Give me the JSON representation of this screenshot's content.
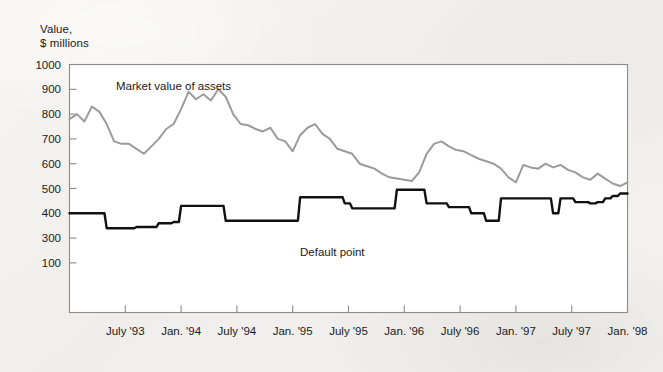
{
  "figure": {
    "background_color": "#f2f1ef",
    "plot_background_color": "#ffffff",
    "frame_color": "#8a8a8a"
  },
  "chart_data": {
    "type": "line",
    "title": "",
    "ylabel": "Value,\n$ millions",
    "xlabel": "",
    "grid": false,
    "legend_position": "inline-annotations",
    "ylim": [
      0,
      1000
    ],
    "ytick_labels": [
      "1000",
      "900",
      "800",
      "700",
      "600",
      "500",
      "400",
      "300",
      "100"
    ],
    "ytick_values": [
      1000,
      900,
      800,
      700,
      600,
      500,
      400,
      300,
      200
    ],
    "xtick_labels": [
      "July '93",
      "Jan. '94",
      "July '94",
      "Jan. '95",
      "July '95",
      "Jan. '96",
      "July '96",
      "Jan. '97",
      "July '97",
      "Jan. '98"
    ],
    "x_start_label": "Jan. '93",
    "x_end_label": "Jan. '98",
    "series": [
      {
        "name": "Market value of assets",
        "color": "#9b9b9b",
        "line_width": 2.0,
        "style": "polyline",
        "values": [
          780,
          800,
          770,
          830,
          810,
          760,
          690,
          680,
          680,
          660,
          640,
          670,
          700,
          740,
          760,
          820,
          890,
          860,
          880,
          855,
          900,
          870,
          800,
          760,
          755,
          740,
          730,
          745,
          700,
          690,
          650,
          715,
          745,
          760,
          720,
          700,
          660,
          650,
          640,
          600,
          590,
          580,
          560,
          545,
          540,
          535,
          530,
          565,
          640,
          680,
          690,
          670,
          655,
          650,
          635,
          620,
          610,
          600,
          580,
          545,
          525,
          595,
          585,
          580,
          600,
          585,
          595,
          575,
          565,
          545,
          535,
          560,
          540,
          520,
          510,
          525
        ]
      },
      {
        "name": "Default point",
        "color": "#111111",
        "line_width": 2.4,
        "style": "step",
        "values": [
          400,
          400,
          400,
          400,
          400,
          340,
          340,
          340,
          340,
          345,
          345,
          345,
          360,
          360,
          365,
          430,
          430,
          430,
          430,
          430,
          430,
          370,
          370,
          370,
          370,
          370,
          370,
          370,
          370,
          370,
          370,
          465,
          465,
          465,
          465,
          465,
          465,
          440,
          420,
          420,
          420,
          420,
          420,
          420,
          495,
          495,
          495,
          495,
          440,
          440,
          440,
          425,
          425,
          425,
          400,
          400,
          370,
          370,
          460,
          460,
          460,
          460,
          460,
          460,
          460,
          400,
          460,
          460,
          445,
          445,
          440,
          445,
          460,
          470,
          480,
          480
        ]
      }
    ]
  }
}
